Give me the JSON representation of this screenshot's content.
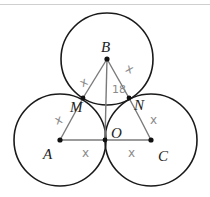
{
  "diagram": {
    "type": "geometry",
    "colors": {
      "circle": "#1a1a1a",
      "segment": "#7a7a7a",
      "annotation": "#8a8a8a",
      "point": "#111111"
    },
    "points": [
      {
        "id": "A",
        "label": "A",
        "x": 60,
        "y": 140
      },
      {
        "id": "B",
        "label": "B",
        "x": 107,
        "y": 59
      },
      {
        "id": "C",
        "label": "C",
        "x": 151,
        "y": 140
      },
      {
        "id": "O",
        "label": "O",
        "x": 105,
        "y": 140
      },
      {
        "id": "M",
        "label": "M",
        "x": 83,
        "y": 98
      },
      {
        "id": "N",
        "label": "N",
        "x": 129,
        "y": 98
      }
    ],
    "circles": [
      {
        "center": "B",
        "r": 46
      },
      {
        "center": "A",
        "r": 46
      },
      {
        "center": "C",
        "r": 46
      }
    ],
    "segments": [
      [
        "B",
        "M"
      ],
      [
        "B",
        "N"
      ],
      [
        "B",
        "O"
      ],
      [
        "A",
        "M"
      ],
      [
        "A",
        "O"
      ],
      [
        "O",
        "C"
      ],
      [
        "N",
        "C"
      ]
    ],
    "annotations": [
      {
        "text": "x",
        "near": "BM"
      },
      {
        "text": "x",
        "near": "BN"
      },
      {
        "text": "18",
        "near": "BO"
      },
      {
        "text": "x",
        "near": "AM"
      },
      {
        "text": "x",
        "near": "NC"
      },
      {
        "text": "x",
        "near": "AO"
      },
      {
        "text": "x",
        "near": "OC"
      }
    ]
  },
  "labels": {
    "A": "A",
    "B": "B",
    "C": "C",
    "O": "O",
    "M": "M",
    "N": "N"
  },
  "marks": {
    "bm": "x",
    "bn": "x",
    "bo": "18",
    "am": "x",
    "nc": "x",
    "ao": "x",
    "oc": "x"
  }
}
